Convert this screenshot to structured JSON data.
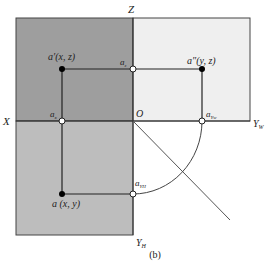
{
  "figure": {
    "caption": "(b)",
    "planes": {
      "V": {
        "color": "#9e9e9e"
      },
      "H": {
        "color": "#bdbdbd"
      },
      "W": {
        "color": "#efefef"
      }
    },
    "axes": {
      "z": "Z",
      "x": "X",
      "origin": "O",
      "yw": "Y",
      "yw_sub": "W",
      "yh": "Y",
      "yh_sub": "H"
    },
    "points": {
      "a_prime": {
        "label": "a′(x, z)"
      },
      "a_double_prime": {
        "label": "a″(y, z)"
      },
      "a": {
        "label": "a (x, y)"
      },
      "az": {
        "label": "a",
        "sub": "z"
      },
      "ax": {
        "label": "a",
        "sub": "x"
      },
      "ayw": {
        "label": "a",
        "sub": "Yw"
      },
      "ayh": {
        "label": "a",
        "sub": "YH"
      }
    }
  }
}
